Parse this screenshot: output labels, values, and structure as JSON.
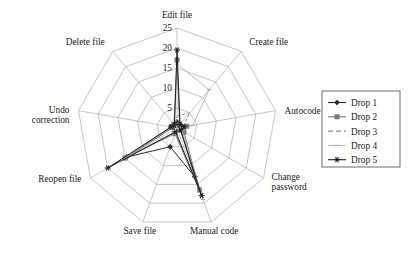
{
  "chart_data": {
    "type": "radar",
    "title": "",
    "categories": [
      "Edit file",
      "Create file",
      "Autocode",
      "Change password",
      "Manual code",
      "Save file",
      "Reopen file",
      "Undo correction",
      "Delete file"
    ],
    "rmin": 0,
    "rmax": 25,
    "rticks": [
      5,
      10,
      15,
      20,
      25
    ],
    "rtick_labels": [
      "5",
      "10",
      "15",
      "20",
      "25"
    ],
    "grid": true,
    "legend_position": "right",
    "series": [
      {
        "name": "Drop 1",
        "marker": "diamond",
        "linestyle": "solid",
        "color": "#2b2b2b",
        "values": [
          1.5,
          0.8,
          2.0,
          1.2,
          13.0,
          5.0,
          14.5,
          1.0,
          1.0
        ]
      },
      {
        "name": "Drop 2",
        "marker": "square",
        "linestyle": "solid",
        "color": "#7a7a7a",
        "values": [
          17.0,
          1.0,
          2.5,
          2.0,
          16.5,
          1.5,
          15.0,
          1.5,
          1.2
        ]
      },
      {
        "name": "Drop 3",
        "marker": "none",
        "linestyle": "dashed",
        "color": "#8c8c8c",
        "values": [
          3.0,
          5.0,
          1.5,
          1.0,
          17.5,
          1.0,
          14.8,
          1.0,
          0.8
        ]
      },
      {
        "name": "Drop 4",
        "marker": "tick",
        "linestyle": "solid",
        "color": "#a8a8a8",
        "values": [
          16.0,
          12.5,
          4.0,
          1.5,
          19.0,
          1.2,
          15.2,
          1.2,
          1.0
        ]
      },
      {
        "name": "Drop 5",
        "marker": "asterisk",
        "linestyle": "solid",
        "color": "#1f1f1f",
        "values": [
          19.5,
          1.2,
          1.8,
          1.0,
          18.0,
          1.0,
          20.0,
          1.5,
          1.0
        ]
      }
    ]
  },
  "legend": {
    "entries": [
      {
        "label": "Drop 1"
      },
      {
        "label": "Drop 2"
      },
      {
        "label": "Drop 3"
      },
      {
        "label": "Drop 4"
      },
      {
        "label": "Drop 5"
      }
    ]
  }
}
